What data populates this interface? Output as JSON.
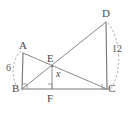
{
  "figure": {
    "vertices": [
      {
        "id": "A",
        "label": "A",
        "x": 23,
        "y": 53
      },
      {
        "id": "B",
        "label": "B",
        "x": 22,
        "y": 89
      },
      {
        "id": "C",
        "label": "C",
        "x": 107,
        "y": 89
      },
      {
        "id": "D",
        "label": "D",
        "x": 106,
        "y": 22
      },
      {
        "id": "E",
        "label": "E",
        "x": 52,
        "y": 66
      },
      {
        "id": "F",
        "label": "F",
        "x": 52,
        "y": 89
      }
    ],
    "measures": [
      {
        "id": "AB",
        "label": "6",
        "value": 6,
        "segment": "AB",
        "x": 6,
        "y": 67
      },
      {
        "id": "DC",
        "label": "12",
        "value": 12,
        "segment": "DC",
        "x": 113,
        "y": 48
      },
      {
        "id": "EF",
        "label": "x",
        "value": null,
        "segment": "EF",
        "x": 56,
        "y": 73
      }
    ],
    "right_angles": [
      "B",
      "F",
      "C"
    ],
    "colors": {
      "line": "#8a8a8a",
      "dashed_arc": "#a8a8a8",
      "label_text": "#4a4a4a",
      "background": "#fefefe"
    }
  }
}
